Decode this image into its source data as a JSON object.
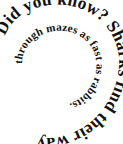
{
  "figure": {
    "kind": "spiral-text-graphic",
    "background_color": "#ffffff",
    "text_color": "#111111",
    "full_text": "Did you know? Sharks find their way through mazes as fast as rabbits.",
    "rings": [
      {
        "id": "outer",
        "text": "Did you know? Sharks find their way",
        "direction": "clockwise",
        "start_position": "upper-left"
      },
      {
        "id": "inner",
        "text": "through mazes as fast as rabbits.",
        "direction": "clockwise",
        "start_position": "left"
      }
    ],
    "headline": "Did you know?",
    "fact": "Sharks find their way through mazes as fast as rabbits."
  }
}
